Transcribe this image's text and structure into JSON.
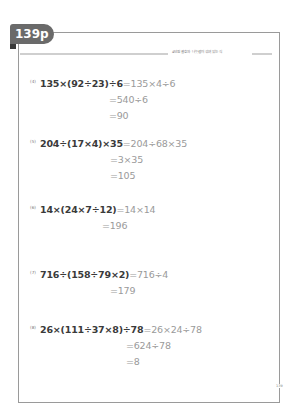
{
  "page": {
    "tab_label": "139p",
    "header_text": "4단원 괄호와 나눗셈이 섞여 있는 식",
    "page_number": "139"
  },
  "problems": [
    {
      "label": "(4)",
      "expression": "135×(92÷23)÷6",
      "first_result": "=135×4÷6",
      "steps": [
        "=540÷6",
        "=90"
      ]
    },
    {
      "label": "(5)",
      "expression": "204÷(17×4)×35",
      "first_result": "=204÷68×35",
      "steps": [
        "=3×35",
        "=105"
      ]
    },
    {
      "label": "(6)",
      "expression": "14×(24×7÷12)",
      "first_result": "=14×14",
      "steps": [
        "=196"
      ]
    },
    {
      "label": "(7)",
      "expression": "716÷(158÷79×2)",
      "first_result": "=716÷4",
      "steps": [
        "=179"
      ]
    },
    {
      "label": "(8)",
      "expression": "26×(111÷37×8)÷78",
      "first_result": "=26×24÷78",
      "steps": [
        "=624÷78",
        "=8"
      ]
    }
  ]
}
